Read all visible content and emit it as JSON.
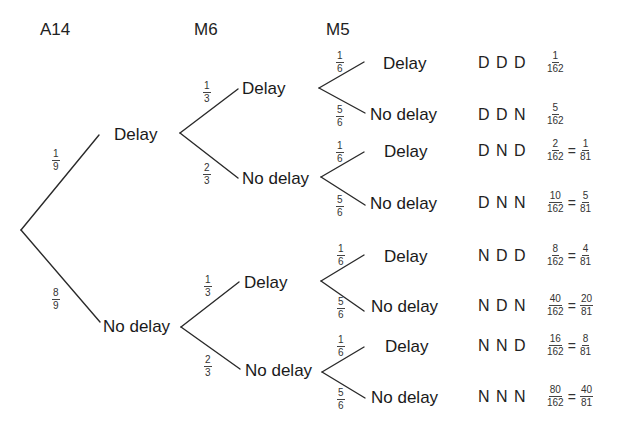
{
  "headers": {
    "a14": "A14",
    "m6": "M6",
    "m5": "M5"
  },
  "level1": [
    {
      "label": "Delay",
      "prob": {
        "num": "1",
        "den": "9"
      }
    },
    {
      "label": "No delay",
      "prob": {
        "num": "8",
        "den": "9"
      }
    }
  ],
  "level2": [
    {
      "label": "Delay",
      "prob": {
        "num": "1",
        "den": "3"
      }
    },
    {
      "label": "No delay",
      "prob": {
        "num": "2",
        "den": "3"
      }
    },
    {
      "label": "Delay",
      "prob": {
        "num": "1",
        "den": "3"
      }
    },
    {
      "label": "No delay",
      "prob": {
        "num": "2",
        "den": "3"
      }
    }
  ],
  "level3": [
    {
      "label": "Delay",
      "prob": {
        "num": "1",
        "den": "6"
      }
    },
    {
      "label": "No delay",
      "prob": {
        "num": "5",
        "den": "6"
      }
    },
    {
      "label": "Delay",
      "prob": {
        "num": "1",
        "den": "6"
      }
    },
    {
      "label": "No delay",
      "prob": {
        "num": "5",
        "den": "6"
      }
    },
    {
      "label": "Delay",
      "prob": {
        "num": "1",
        "den": "6"
      }
    },
    {
      "label": "No delay",
      "prob": {
        "num": "5",
        "den": "6"
      }
    },
    {
      "label": "Delay",
      "prob": {
        "num": "1",
        "den": "6"
      }
    },
    {
      "label": "No delay",
      "prob": {
        "num": "5",
        "den": "6"
      }
    }
  ],
  "outcomes": [
    {
      "sequence": "D D D",
      "raw": {
        "num": "1",
        "den": "162"
      },
      "simplified": null
    },
    {
      "sequence": "D D N",
      "raw": {
        "num": "5",
        "den": "162"
      },
      "simplified": null
    },
    {
      "sequence": "D N D",
      "raw": {
        "num": "2",
        "den": "162"
      },
      "equals": "=",
      "simplified": {
        "num": "1",
        "den": "81"
      }
    },
    {
      "sequence": "D N N",
      "raw": {
        "num": "10",
        "den": "162"
      },
      "equals": "=",
      "simplified": {
        "num": "5",
        "den": "81"
      }
    },
    {
      "sequence": "N D D",
      "raw": {
        "num": "8",
        "den": "162"
      },
      "equals": "=",
      "simplified": {
        "num": "4",
        "den": "81"
      }
    },
    {
      "sequence": "N D N",
      "raw": {
        "num": "40",
        "den": "162"
      },
      "equals": "=",
      "simplified": {
        "num": "20",
        "den": "81"
      }
    },
    {
      "sequence": "N N D",
      "raw": {
        "num": "16",
        "den": "162"
      },
      "equals": "=",
      "simplified": {
        "num": "8",
        "den": "81"
      }
    },
    {
      "sequence": "N N N",
      "raw": {
        "num": "80",
        "den": "162"
      },
      "equals": "=",
      "simplified": {
        "num": "40",
        "den": "81"
      }
    }
  ],
  "colors": {
    "line": "#2a2a2a",
    "text": "#1a1a1a",
    "background": "#ffffff"
  }
}
